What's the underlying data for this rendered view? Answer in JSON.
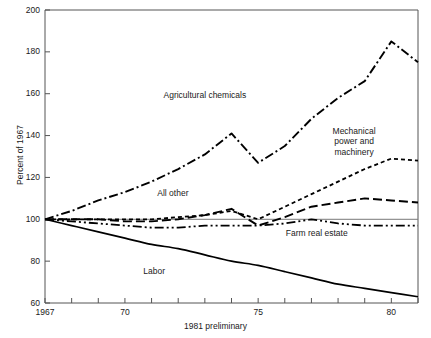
{
  "chart_data": {
    "type": "line",
    "title": "",
    "subtitle": "",
    "xlabel": "1981 preliminary",
    "ylabel": "Percent of 1967",
    "xlim": [
      1967,
      1981
    ],
    "ylim": [
      60,
      200
    ],
    "grid": false,
    "legend_position": "inline-annotations",
    "baseline_value": 100,
    "x": [
      1967,
      1968,
      1969,
      1970,
      1971,
      1972,
      1973,
      1974,
      1975,
      1976,
      1977,
      1978,
      1979,
      1980,
      1981
    ],
    "xticks": [
      1967,
      1968,
      1969,
      1970,
      1971,
      1972,
      1973,
      1974,
      1975,
      1976,
      1977,
      1978,
      1979,
      1980,
      1981
    ],
    "xtick_labels": [
      {
        "value": 1967,
        "label": "1967"
      },
      {
        "value": 1970,
        "label": "70"
      },
      {
        "value": 1975,
        "label": "75"
      },
      {
        "value": 1980,
        "label": "80"
      }
    ],
    "yticks": [
      60,
      80,
      100,
      120,
      140,
      160,
      180,
      200
    ],
    "ytick_labels": [
      "60",
      "80",
      "100",
      "120",
      "140",
      "160",
      "180",
      "200"
    ],
    "series": [
      {
        "name": "Agricultural chemicals",
        "style": "dash-dot",
        "label_x": 1973.0,
        "label_y": 159,
        "values": [
          100,
          104,
          109,
          113,
          118,
          124,
          131,
          141,
          127,
          135,
          148,
          158,
          166,
          185,
          175
        ],
        "peak": {
          "year": 1980,
          "value": 185
        },
        "end_value": 175
      },
      {
        "name": "Mechanical power and machinery",
        "style": "dashed-short",
        "label_x": 1978.6,
        "label_y": 137,
        "values": [
          100,
          100,
          100,
          100,
          100,
          101,
          102,
          104,
          100,
          106,
          112,
          118,
          124,
          129,
          128
        ],
        "end_value": 128
      },
      {
        "name": "All other",
        "style": "dashed-long",
        "label_x": 1971.8,
        "label_y": 112,
        "values": [
          100,
          100,
          100,
          99,
          99,
          100,
          102,
          105,
          97,
          101,
          106,
          108,
          110,
          109,
          108
        ],
        "end_value": 108
      },
      {
        "name": "Farm real estate",
        "style": "dash-dot-dot",
        "label_x": 1977.2,
        "label_y": 93,
        "values": [
          100,
          99,
          98,
          97,
          96,
          96,
          97,
          97,
          97,
          98,
          100,
          98,
          97,
          97,
          97
        ],
        "end_value": 97
      },
      {
        "name": "Labor",
        "style": "solid",
        "label_x": 1971.1,
        "label_y": 75,
        "values": [
          100,
          97,
          94,
          91,
          88,
          86,
          83,
          80,
          78,
          75,
          72,
          69,
          67,
          65,
          63
        ],
        "end_value": 63
      }
    ]
  },
  "figure": {
    "frame_color": "#555555",
    "line_color": "#000000",
    "baseline_color": "#777777",
    "background": "#ffffff"
  }
}
